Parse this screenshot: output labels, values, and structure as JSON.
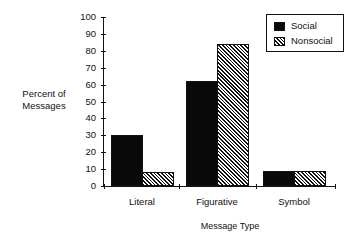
{
  "chart_data": {
    "type": "bar",
    "title": "",
    "xlabel": "Message Type",
    "ylabel": "Percent of Messages",
    "ylabel_lines": [
      "Percent of",
      "Messages"
    ],
    "categories": [
      "Literal",
      "Figurative",
      "Symbol"
    ],
    "series": [
      {
        "name": "Social",
        "values": [
          30,
          62,
          9
        ],
        "fill": "solid black"
      },
      {
        "name": "Nonsocial",
        "values": [
          8,
          84,
          9
        ],
        "fill": "diagonal hatch"
      }
    ],
    "ylim": [
      0,
      100
    ],
    "yticks": [
      0,
      10,
      20,
      30,
      40,
      50,
      60,
      70,
      80,
      90,
      100
    ],
    "grid": false,
    "legend_position": "top-right"
  },
  "legend": {
    "items": [
      "Social",
      "Nonsocial"
    ]
  },
  "colors": {
    "social": "#0a0a0a",
    "nonsocial_hatch": "#111111",
    "background": "#ffffff"
  }
}
